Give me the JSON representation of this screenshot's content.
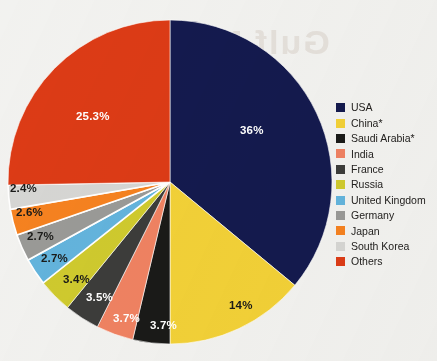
{
  "background": {
    "paper_color": "#f2f2f0",
    "bleed_through_text": "Gulf Military"
  },
  "chart_data": {
    "type": "pie",
    "title": "",
    "subtitle": "",
    "xlabel": "",
    "ylabel": "",
    "grid": false,
    "legend_position": "right",
    "start_angle_deg": 0,
    "direction": "clockwise",
    "categories": [
      "USA",
      "China*",
      "Saudi Arabia*",
      "India",
      "France",
      "Russia",
      "United Kingdom",
      "Germany",
      "Japan",
      "South Korea",
      "Others"
    ],
    "values": [
      36,
      14,
      3.7,
      3.7,
      3.5,
      3.4,
      2.7,
      2.7,
      2.6,
      2.4,
      25.3
    ],
    "value_labels": [
      "36%",
      "14%",
      "3.7%",
      "3.7%",
      "3.5%",
      "3.4%",
      "2.7%",
      "2.7%",
      "2.6%",
      "2.4%",
      "25.3%"
    ],
    "colors": [
      "#141a4e",
      "#f2d137",
      "#1a1a18",
      "#ef8262",
      "#3c3c3a",
      "#cfca2e",
      "#63b4dd",
      "#9a9a97",
      "#f58220",
      "#d6d6d4",
      "#dc3b16"
    ],
    "label_text_colors": [
      "#ffffff",
      "#1a1a18",
      "#ffffff",
      "#ffffff",
      "#ffffff",
      "#1a1a18",
      "#1a1a18",
      "#1a1a18",
      "#1a1a18",
      "#1a1a18",
      "#ffffff"
    ]
  },
  "slice_labels": [
    {
      "text": "36%",
      "x": 240,
      "y": 134,
      "color": "#ffffff"
    },
    {
      "text": "14%",
      "x": 229,
      "y": 309,
      "color": "#1a1a18"
    },
    {
      "text": "3.7%",
      "x": 150,
      "y": 329,
      "color": "#ffffff"
    },
    {
      "text": "3.7%",
      "x": 113,
      "y": 322,
      "color": "#ffffff"
    },
    {
      "text": "3.5%",
      "x": 86,
      "y": 301,
      "color": "#ffffff"
    },
    {
      "text": "3.4%",
      "x": 63,
      "y": 283,
      "color": "#1a1a18"
    },
    {
      "text": "2.7%",
      "x": 41,
      "y": 262,
      "color": "#1a1a18"
    },
    {
      "text": "2.7%",
      "x": 27,
      "y": 240,
      "color": "#1a1a18"
    },
    {
      "text": "2.6%",
      "x": 16,
      "y": 216,
      "color": "#1a1a18"
    },
    {
      "text": "2.4%",
      "x": 10,
      "y": 192,
      "color": "#1a1a18"
    },
    {
      "text": "25.3%",
      "x": 76,
      "y": 120,
      "color": "#ffffff"
    }
  ],
  "legend": {
    "items": [
      {
        "label": "USA",
        "color": "#141a4e"
      },
      {
        "label": "China*",
        "color": "#f2d137"
      },
      {
        "label": "Saudi Arabia*",
        "color": "#1a1a18"
      },
      {
        "label": "India",
        "color": "#ef8262"
      },
      {
        "label": "France",
        "color": "#3c3c3a"
      },
      {
        "label": "Russia",
        "color": "#cfca2e"
      },
      {
        "label": "United Kingdom",
        "color": "#63b4dd"
      },
      {
        "label": "Germany",
        "color": "#9a9a97"
      },
      {
        "label": "Japan",
        "color": "#f58220"
      },
      {
        "label": "South Korea",
        "color": "#d6d6d4"
      },
      {
        "label": "Others",
        "color": "#dc3b16"
      }
    ]
  },
  "geometry": {
    "center_x": 170,
    "center_y": 182,
    "radius": 162
  }
}
